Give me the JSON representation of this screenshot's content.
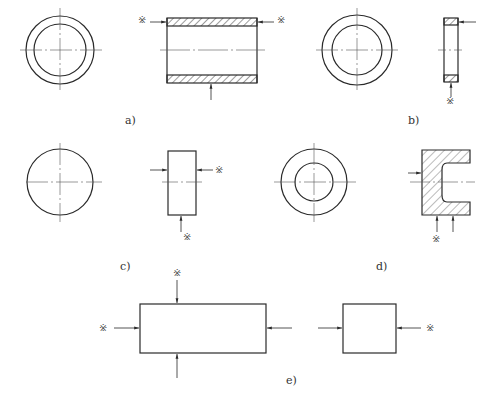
{
  "figure": {
    "panels": [
      {
        "id": "a",
        "label": "a)",
        "label_pos": [
          125,
          122
        ],
        "description": "Tube: ring end view and hatched longitudinal section with three locating arrows"
      },
      {
        "id": "b",
        "label": "b)",
        "label_pos": [
          408,
          122
        ],
        "description": "Thin ring: end view and narrow hatched section"
      },
      {
        "id": "c",
        "label": "c)",
        "label_pos": [
          120,
          268
        ],
        "description": "Solid cylinder: circle end view and rectangular side view"
      },
      {
        "id": "d",
        "label": "d)",
        "label_pos": [
          376,
          268
        ],
        "description": "Cup part: ring end view and hatched section with inner recess"
      },
      {
        "id": "e",
        "label": "e)",
        "label_pos": [
          286,
          382
        ],
        "description": "Rectangular block: two orthographic views with locating arrows"
      }
    ],
    "marks": [
      {
        "symbol": "※",
        "x": 137,
        "y": 19
      },
      {
        "symbol": "※",
        "x": 278,
        "y": 19
      },
      {
        "symbol": "※",
        "x": 445,
        "y": 100
      },
      {
        "symbol": "※",
        "x": 216,
        "y": 163
      },
      {
        "symbol": "※",
        "x": 184,
        "y": 235
      },
      {
        "symbol": "※",
        "x": 433,
        "y": 237
      },
      {
        "symbol": "※",
        "x": 173,
        "y": 269
      },
      {
        "symbol": "※",
        "x": 99,
        "y": 325
      },
      {
        "symbol": "※",
        "x": 427,
        "y": 325
      }
    ],
    "caption": ""
  },
  "colors": {
    "line": "#2a2a2a",
    "center_line": "#555555",
    "hatch": "#3a3a3a",
    "background": "#ffffff"
  }
}
